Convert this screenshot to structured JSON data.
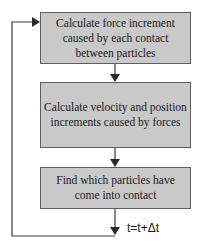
{
  "diagram": {
    "type": "flowchart",
    "boxes": [
      {
        "id": "step-1",
        "text": "Calculate force increment caused by each contact between particles"
      },
      {
        "id": "step-2",
        "text": "Calculate velocity and position increments caused by forces"
      },
      {
        "id": "step-3",
        "text": "Find which particles have come into contact"
      }
    ],
    "loop_label": "t=t+Δt",
    "colors": {
      "box_fill": "#c9c9c9",
      "box_border": "#5e5e5e",
      "line": "#3a3a3a",
      "text": "#1a1a1a"
    }
  }
}
